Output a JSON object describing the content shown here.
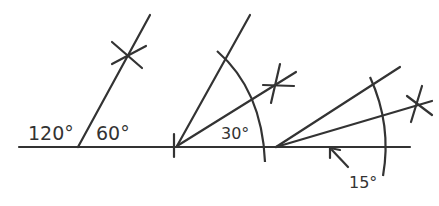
{
  "diagram": {
    "type": "geometric-construction",
    "stroke_color": "#333333",
    "background": "#ffffff",
    "figures": [
      {
        "id": "fig-60",
        "labels": [
          {
            "text": "120°",
            "role": "supplementary-angle"
          },
          {
            "text": "60°",
            "role": "constructed-angle"
          }
        ]
      },
      {
        "id": "fig-30",
        "labels": [
          {
            "text": "30°",
            "role": "bisected-angle"
          }
        ]
      },
      {
        "id": "fig-15",
        "labels": [
          {
            "text": "15°",
            "role": "bisected-angle"
          }
        ]
      }
    ]
  }
}
